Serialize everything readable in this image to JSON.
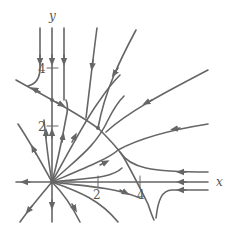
{
  "figure": {
    "type": "phase-portrait",
    "axes": {
      "x_label": "x",
      "y_label": "y",
      "y_ticks": [
        "4",
        "2"
      ],
      "x_ticks": [
        "2",
        "4"
      ]
    },
    "colors": {
      "curve": "#666666",
      "axis": "#666666",
      "background": "#ffffff"
    }
  }
}
